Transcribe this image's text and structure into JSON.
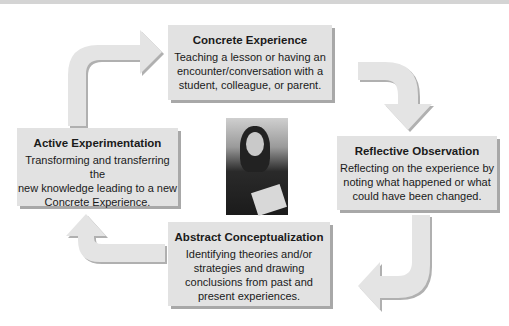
{
  "diagram": {
    "type": "cycle",
    "stages": [
      {
        "id": "concrete",
        "title": "Concrete Experience",
        "description_lines": [
          "Teaching a lesson or having an",
          "encounter/conversation with a",
          "student, colleague, or parent."
        ]
      },
      {
        "id": "reflective",
        "title": "Reflective Observation",
        "description_lines": [
          "Reflecting on the experience by",
          "noting what happened or what",
          "could have been changed."
        ]
      },
      {
        "id": "abstract",
        "title": "Abstract Conceptualization",
        "description_lines": [
          "Identifying theories and/or",
          "strategies and drawing",
          "conclusions from past and",
          "present experiences."
        ]
      },
      {
        "id": "active",
        "title": "Active Experimentation",
        "description_lines": [
          "Transforming and transferring the",
          "new knowledge leading to a new",
          "Concrete Experience."
        ]
      }
    ],
    "flow": [
      "concrete",
      "reflective",
      "abstract",
      "active",
      "concrete"
    ],
    "center_image": "photo-of-teacher",
    "colors": {
      "box_fill": "#e2e2e2",
      "box_shadow": "#a8a8a8",
      "arrow_fill": "#e4e4e4",
      "arrow_shadow": "#b0b0b0",
      "text": "#1a1a1a"
    }
  }
}
